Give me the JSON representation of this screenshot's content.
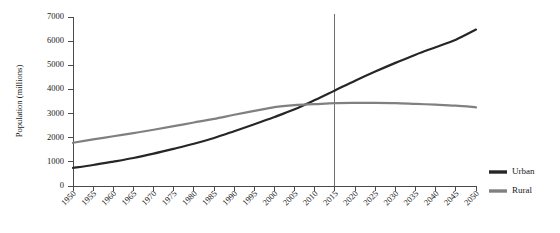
{
  "chart_data": {
    "type": "line",
    "title": "",
    "subtitle": "",
    "xlabel": "",
    "ylabel": "Population (millions)",
    "xlim": [
      1950,
      2050
    ],
    "ylim": [
      0,
      7000
    ],
    "grid": false,
    "legend_position": "right",
    "x": [
      1950,
      1955,
      1960,
      1965,
      1970,
      1975,
      1980,
      1985,
      1990,
      1995,
      2000,
      2005,
      2010,
      2015,
      2020,
      2025,
      2030,
      2035,
      2040,
      2045,
      2050
    ],
    "xtick_labels": [
      "1950",
      "1955",
      "1960",
      "1965",
      "1970",
      "1975",
      "1980",
      "1985",
      "1990",
      "1995",
      "2000",
      "2005",
      "2010",
      "2015",
      "2020",
      "2025",
      "2030",
      "2035",
      "2040",
      "2045",
      "2050"
    ],
    "ytick_values": [
      0,
      1000,
      2000,
      3000,
      4000,
      5000,
      6000,
      7000
    ],
    "ytick_labels": [
      "0",
      "1000",
      "2000",
      "3000",
      "4000",
      "5000",
      "6000",
      "7000"
    ],
    "series": [
      {
        "name": "Urban",
        "color": "#262626",
        "width": 2.2,
        "values": [
          750,
          870,
          1010,
          1160,
          1340,
          1540,
          1750,
          1990,
          2270,
          2560,
          2860,
          3180,
          3560,
          3960,
          4360,
          4740,
          5100,
          5440,
          5750,
          6060,
          6480
        ]
      },
      {
        "name": "Rural",
        "color": "#808080",
        "width": 2.2,
        "values": [
          1790,
          1930,
          2060,
          2190,
          2330,
          2480,
          2630,
          2780,
          2950,
          3110,
          3270,
          3350,
          3390,
          3430,
          3440,
          3440,
          3430,
          3400,
          3370,
          3330,
          3260
        ]
      }
    ],
    "annotations": [
      {
        "type": "vertical-line",
        "name": "year-marker-2015",
        "x": 2015,
        "color": "#6e6e6e"
      }
    ]
  },
  "legend": {
    "items": [
      {
        "label": "Urban",
        "color": "#262626"
      },
      {
        "label": "Rural",
        "color": "#808080"
      }
    ]
  }
}
